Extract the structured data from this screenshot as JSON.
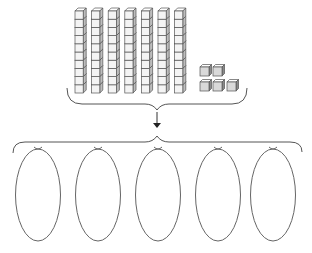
{
  "diagram": {
    "description": "Base-ten blocks: 7 tens rods and 5 unit cubes, grouped and divided into 5 equal groups",
    "tens_rods": {
      "count": 7,
      "cubes_per_rod": 10
    },
    "unit_cubes": {
      "count": 5,
      "rows": [
        2,
        3
      ]
    },
    "total_value": 75,
    "groups": {
      "count": 5,
      "shape": "ellipse"
    },
    "colors": {
      "stroke": "#555555",
      "cube_face": "#f4f4f4",
      "cube_side": "#bdbdbd",
      "unit_face": "#d9d9d9",
      "unit_side": "#8a8a8a",
      "ellipse_stroke": "#666666"
    }
  }
}
